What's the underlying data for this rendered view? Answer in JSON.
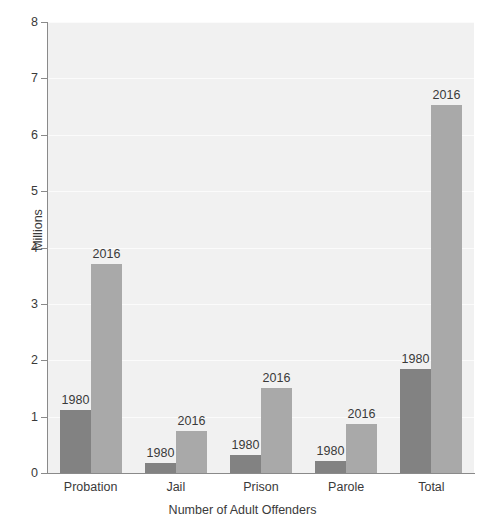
{
  "chart_data": {
    "type": "bar",
    "title": "",
    "xlabel": "Number of Adult Offenders",
    "ylabel": "Millions",
    "categories": [
      "Probation",
      "Jail",
      "Prison",
      "Parole",
      "Total"
    ],
    "series": [
      {
        "name": "1980",
        "color": "#828282",
        "values": [
          1.11,
          0.18,
          0.32,
          0.22,
          1.84
        ]
      },
      {
        "name": "2016",
        "color": "#a9a9a9",
        "values": [
          3.71,
          0.74,
          1.51,
          0.87,
          6.53
        ]
      }
    ],
    "ylim": [
      0,
      8
    ],
    "ytick_labels": [
      "0",
      "1",
      "2",
      "3",
      "4",
      "5",
      "6",
      "7",
      "8"
    ],
    "ytick_values": [
      0,
      1,
      2,
      3,
      4,
      5,
      6,
      7,
      8
    ],
    "grid": true,
    "grid_color": "#fbfbfb",
    "plot_background": "#f1f1f1",
    "axis_color": "#8a8a8a",
    "legend": "none",
    "bar_labels": [
      {
        "category": "Probation",
        "series": "1980",
        "text": "1980"
      },
      {
        "category": "Probation",
        "series": "2016",
        "text": "2016"
      },
      {
        "category": "Jail",
        "series": "1980",
        "text": "1980"
      },
      {
        "category": "Jail",
        "series": "2016",
        "text": "2016"
      },
      {
        "category": "Prison",
        "series": "1980",
        "text": "1980"
      },
      {
        "category": "Prison",
        "series": "2016",
        "text": "2016"
      },
      {
        "category": "Parole",
        "series": "1980",
        "text": "1980"
      },
      {
        "category": "Parole",
        "series": "2016",
        "text": "2016"
      },
      {
        "category": "Total",
        "series": "1980",
        "text": "1980"
      },
      {
        "category": "Total",
        "series": "2016",
        "text": "2016"
      }
    ]
  }
}
